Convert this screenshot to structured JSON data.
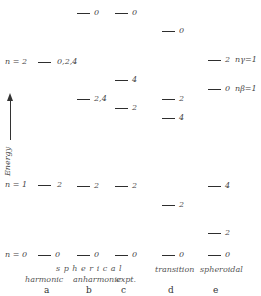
{
  "axis": {
    "label": "Energy"
  },
  "columns": {
    "a": {
      "letter": "a",
      "caption": "harmonic"
    },
    "b": {
      "letter": "b",
      "caption": "anharmonic"
    },
    "c": {
      "letter": "c",
      "caption": "expt."
    },
    "d": {
      "letter": "d",
      "caption": "transition"
    },
    "e": {
      "letter": "e",
      "caption": "spheroidal"
    }
  },
  "group_caption": "s p h e r i c a l",
  "quantum_labels": {
    "n2": "n = 2",
    "n1": "n = 1",
    "n0": "n = 0",
    "ngamma": "nγ=1",
    "nbeta": "nβ=1"
  },
  "levels": {
    "a": [
      {
        "label": "0,2,4",
        "y": 62
      },
      {
        "label": "2",
        "y": 185
      },
      {
        "label": "0",
        "y": 255
      }
    ],
    "b": [
      {
        "label": "0",
        "y": 13
      },
      {
        "label": "2,4",
        "y": 99
      },
      {
        "label": "2",
        "y": 186
      },
      {
        "label": "0",
        "y": 255
      }
    ],
    "c": [
      {
        "label": "0",
        "y": 13
      },
      {
        "label": "4",
        "y": 80
      },
      {
        "label": "2",
        "y": 108
      },
      {
        "label": "2",
        "y": 186
      },
      {
        "label": "0",
        "y": 255
      }
    ],
    "d": [
      {
        "label": "0",
        "y": 31
      },
      {
        "label": "2",
        "y": 99
      },
      {
        "label": "4",
        "y": 118
      },
      {
        "label": "2",
        "y": 205
      },
      {
        "label": "0",
        "y": 255
      }
    ],
    "e": [
      {
        "label": "2",
        "y": 60
      },
      {
        "label": "0",
        "y": 89
      },
      {
        "label": "4",
        "y": 186
      },
      {
        "label": "2",
        "y": 233
      },
      {
        "label": "0",
        "y": 255
      }
    ]
  }
}
